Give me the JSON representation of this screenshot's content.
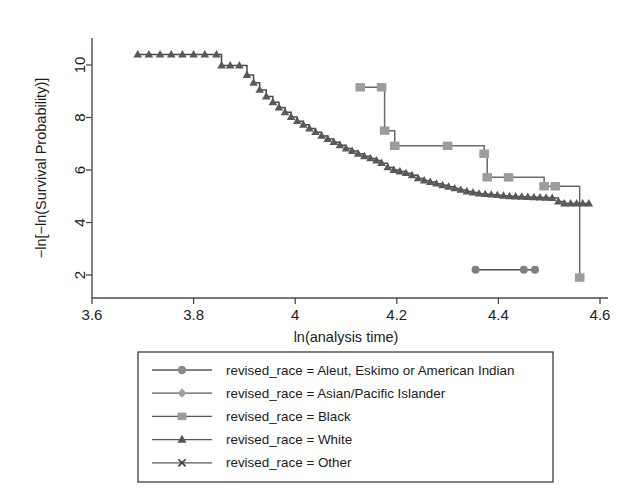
{
  "chart_data": {
    "type": "line",
    "title": "",
    "xlabel": "ln(analysis time)",
    "ylabel": "−ln[−ln(Survival Probability)]",
    "xlim": [
      3.6,
      4.6
    ],
    "ylim": [
      1.6,
      10.9
    ],
    "xticks": [
      3.6,
      3.8,
      4.0,
      4.2,
      4.4,
      4.6
    ],
    "xticklabels": [
      "3.6",
      "3.8",
      "4",
      "4.2",
      "4.4",
      "4.6"
    ],
    "yticks": [
      2,
      4,
      6,
      8,
      10
    ],
    "yticklabels": [
      "2",
      "4",
      "6",
      "8",
      "10"
    ],
    "grid": false,
    "legend_position": "below-plot",
    "legend_title": "",
    "series": [
      {
        "name": "revised_race = Aleut, Eskimo or American Indian",
        "marker": "circle",
        "color": "#808080",
        "line_color": "#4f4f4f",
        "step": "post",
        "x": [
          4.355,
          4.45,
          4.472
        ],
        "y": [
          2.2,
          2.2,
          2.2
        ]
      },
      {
        "name": "revised_race = Asian/Pacific Islander",
        "marker": "diamond",
        "color": "#9a9a9a",
        "line_color": "#6d6d6d",
        "step": "post",
        "x": [],
        "y": []
      },
      {
        "name": "revised_race = Black",
        "marker": "square",
        "color": "#9c9c9c",
        "line_color": "#6a6a6a",
        "step": "post",
        "x": [
          4.128,
          4.17,
          4.176,
          4.196,
          4.3,
          4.372,
          4.378,
          4.42,
          4.49,
          4.512,
          4.56
        ],
        "y": [
          9.15,
          9.15,
          7.5,
          6.92,
          6.92,
          6.62,
          5.72,
          5.72,
          5.38,
          5.38,
          1.9
        ]
      },
      {
        "name": "revised_race = White",
        "marker": "triangle",
        "color": "#595959",
        "line_color": "#4a4a4a",
        "step": "post",
        "x": [
          3.69,
          3.712,
          3.734,
          3.756,
          3.778,
          3.8,
          3.822,
          3.845,
          3.855,
          3.872,
          3.89,
          3.905,
          3.918,
          3.93,
          3.943,
          3.956,
          3.968,
          3.98,
          3.992,
          4.004,
          4.016,
          4.028,
          4.04,
          4.052,
          4.064,
          4.076,
          4.088,
          4.1,
          4.112,
          4.124,
          4.136,
          4.148,
          4.16,
          4.17,
          4.182,
          4.194,
          4.206,
          4.218,
          4.23,
          4.242,
          4.254,
          4.266,
          4.278,
          4.29,
          4.302,
          4.314,
          4.326,
          4.338,
          4.35,
          4.362,
          4.374,
          4.386,
          4.398,
          4.41,
          4.422,
          4.434,
          4.446,
          4.458,
          4.47,
          4.482,
          4.494,
          4.506,
          4.518,
          4.53,
          4.542,
          4.554,
          4.566,
          4.578
        ],
        "y": [
          10.4,
          10.4,
          10.4,
          10.4,
          10.4,
          10.4,
          10.4,
          10.4,
          9.98,
          9.98,
          9.98,
          9.62,
          9.32,
          9.05,
          8.8,
          8.58,
          8.38,
          8.2,
          8.02,
          7.86,
          7.72,
          7.58,
          7.44,
          7.3,
          7.18,
          7.06,
          6.94,
          6.82,
          6.72,
          6.62,
          6.52,
          6.44,
          6.36,
          6.26,
          6.1,
          6.0,
          5.94,
          5.88,
          5.8,
          5.68,
          5.6,
          5.54,
          5.48,
          5.42,
          5.36,
          5.3,
          5.24,
          5.18,
          5.14,
          5.1,
          5.08,
          5.06,
          5.04,
          5.02,
          5.0,
          4.99,
          4.98,
          4.97,
          4.96,
          4.95,
          4.94,
          4.93,
          4.8,
          4.72,
          4.72,
          4.72,
          4.72,
          4.72
        ]
      },
      {
        "name": "revised_race = Other",
        "marker": "x-cross",
        "color": "#3b3b3b",
        "line_color": "#3b3b3b",
        "step": "post",
        "x": [],
        "y": []
      }
    ]
  },
  "legend": {
    "entries": [
      {
        "label": "revised_race = Aleut, Eskimo or American Indian",
        "marker": "circle",
        "color": "#8a8a8a"
      },
      {
        "label": "revised_race = Asian/Pacific Islander",
        "marker": "diamond",
        "color": "#9f9f9f"
      },
      {
        "label": "revised_race = Black",
        "marker": "square",
        "color": "#9c9c9c"
      },
      {
        "label": "revised_race = White",
        "marker": "triangle",
        "color": "#555555"
      },
      {
        "label": "revised_race = Other",
        "marker": "x-cross",
        "color": "#3b3b3b"
      }
    ]
  },
  "axes": {
    "x_title": "ln(analysis time)",
    "y_title": "−ln[−ln(Survival Probability)]"
  },
  "colors": {
    "axis": "#4a4a4a",
    "text": "#1b1b1b",
    "legend_border": "#3c3c3c",
    "background": "#ffffff"
  }
}
